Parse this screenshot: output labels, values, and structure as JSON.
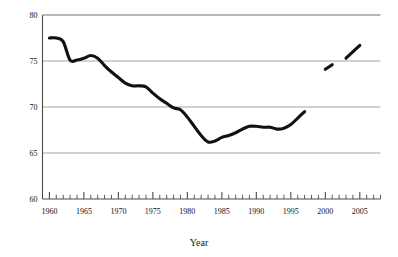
{
  "chart_data": {
    "type": "line",
    "title": "",
    "xlabel": "Year",
    "ylabel": "Percent of Caseloads Comprised by Children",
    "xlim": [
      1959,
      2008
    ],
    "ylim": [
      60,
      80
    ],
    "yticks": [
      60,
      65,
      70,
      75,
      80
    ],
    "ytick_labels": [
      "60",
      "65",
      "70",
      "75",
      "80"
    ],
    "xticks": [
      1960,
      1965,
      1970,
      1975,
      1980,
      1985,
      1990,
      1995,
      2000,
      2005
    ],
    "xtick_labels": [
      "1960",
      "1965",
      "1970",
      "1975",
      "1980",
      "1985",
      "1990",
      "1995",
      "2000",
      "2005"
    ],
    "minor_tick_interval": 1,
    "grid": "horizontal",
    "grid_color": "#9a9a9a",
    "line_color": "#111111",
    "line_width": 3.1,
    "legend": "none",
    "series": [
      {
        "name": "Percent of caseloads comprised by children",
        "x": [
          1960,
          1961,
          1962,
          1963,
          1964,
          1965,
          1966,
          1967,
          1968,
          1969,
          1970,
          1971,
          1972,
          1973,
          1974,
          1975,
          1976,
          1977,
          1978,
          1979,
          1980,
          1981,
          1982,
          1983,
          1984,
          1985,
          1986,
          1987,
          1988,
          1989,
          1990,
          1991,
          1992,
          1993,
          1994,
          1995,
          1996,
          1997
        ],
        "values": [
          77.5,
          77.5,
          77.1,
          75.1,
          75.1,
          75.3,
          75.6,
          75.3,
          74.5,
          73.8,
          73.2,
          72.6,
          72.3,
          72.3,
          72.2,
          71.5,
          70.9,
          70.4,
          69.9,
          69.7,
          68.9,
          67.9,
          66.9,
          66.2,
          66.3,
          66.7,
          66.9,
          67.2,
          67.6,
          67.9,
          67.9,
          67.8,
          67.8,
          67.6,
          67.7,
          68.1,
          68.8,
          69.5
        ]
      },
      {
        "name": "Segment 2000-2001",
        "x": [
          2000,
          2001
        ],
        "values": [
          74.1,
          74.6
        ]
      },
      {
        "name": "Segment 2003-2005",
        "x": [
          2003,
          2005
        ],
        "values": [
          75.3,
          76.7
        ]
      }
    ]
  }
}
